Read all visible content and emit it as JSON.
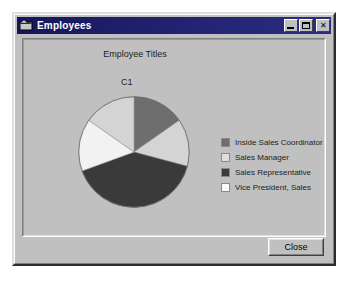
{
  "window": {
    "title": "Employees",
    "icon": "app-window-icon",
    "controls": {
      "minimize": "Minimize",
      "maximize": "Maximize",
      "close": "Close"
    }
  },
  "footer": {
    "close_label": "Close"
  },
  "chart_data": {
    "type": "pie",
    "title": "Employee Titles",
    "series_label": "C1",
    "categories": [
      "Inside Sales Coordinator",
      "Sales Manager",
      "Sales Representative",
      "Vice President, Sales"
    ],
    "slices": [
      {
        "label": "Inside Sales Coordinator",
        "angle_deg": 55,
        "color": "#6e6e6e"
      },
      {
        "label": "Sales Manager",
        "angle_deg": 50,
        "color": "#d4d4d4"
      },
      {
        "label": "Sales Representative",
        "angle_deg": 145,
        "color": "#3a3a3a"
      },
      {
        "label": "Vice President, Sales",
        "angle_deg": 55,
        "color": "#f2f2f2"
      },
      {
        "label": "Sales Manager",
        "angle_deg": 55,
        "color": "#d4d4d4"
      }
    ],
    "legend": [
      {
        "label": "Inside Sales Coordinator",
        "color": "#6e6e6e"
      },
      {
        "label": "Sales Manager",
        "color": "#dedede"
      },
      {
        "label": "Sales Representative",
        "color": "#3a3a3a"
      },
      {
        "label": "Vice President, Sales",
        "color": "#fafafa"
      }
    ],
    "legend_position": "right",
    "grid": false,
    "start_angle_deg": 0,
    "direction": "clockwise"
  },
  "colors": {
    "titlebar": "#1a1a66",
    "face": "#c0c0c0",
    "text": "#1c1c1c"
  }
}
